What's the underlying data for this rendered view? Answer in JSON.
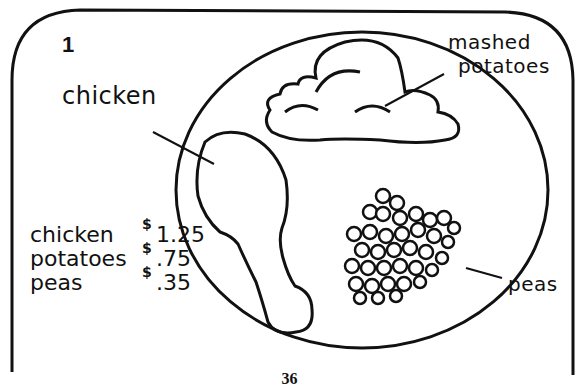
{
  "worksheet": {
    "problem_number": "1",
    "labels": {
      "chicken": "chicken",
      "mashed_potatoes_line1": "mashed",
      "mashed_potatoes_line2": "potatoes",
      "peas": "peas"
    },
    "price_list": [
      {
        "item": "chicken",
        "currency": "$",
        "price": "1.25"
      },
      {
        "item": "potatoes",
        "currency": "$",
        "price": ".75"
      },
      {
        "item": "peas",
        "currency": "$",
        "price": ".35"
      }
    ],
    "page_number": "36"
  },
  "colors": {
    "ink": "#111111",
    "paper": "#ffffff"
  }
}
